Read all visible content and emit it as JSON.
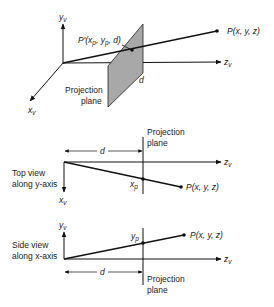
{
  "perspective_view": {
    "y_axis": "y",
    "y_axis_sub": "v",
    "x_axis": "x",
    "x_axis_sub": "v",
    "z_axis": "z",
    "z_axis_sub": "v",
    "point_label": "P(x, y, z)",
    "projected_point_label_prefix": "P′(x",
    "projected_point_label_p1": "p",
    "projected_point_label_mid": ", y",
    "projected_point_label_p2": "p",
    "projected_point_label_end": ", d)",
    "distance_label": "d",
    "plane_label_line1": "Projection",
    "plane_label_line2": "plane",
    "colors": {
      "plane_fill": "#a8a8a8",
      "line": "#111111"
    }
  },
  "top_view": {
    "caption_line1": "Top view",
    "caption_line2": "along y-axis",
    "plane_label_line1": "Projection",
    "plane_label_line2": "plane",
    "distance_label": "d",
    "z_axis": "z",
    "z_axis_sub": "v",
    "x_axis": "x",
    "x_axis_sub": "v",
    "projected_label": "x",
    "projected_label_sub": "p",
    "point_label": "P(x, y, z)"
  },
  "side_view": {
    "caption_line1": "Side view",
    "caption_line2": "along x-axis",
    "plane_label_line1": "Projection",
    "plane_label_line2": "plane",
    "distance_label": "d",
    "z_axis": "z",
    "z_axis_sub": "v",
    "y_axis": "y",
    "y_axis_sub": "v",
    "projected_label": "y",
    "projected_label_sub": "p",
    "point_label": "P(x, y, z)"
  }
}
